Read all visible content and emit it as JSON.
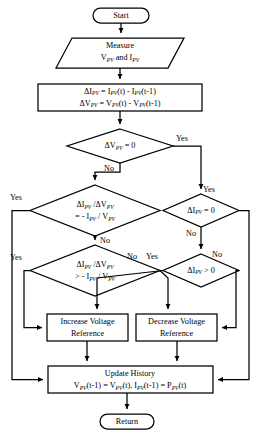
{
  "diagram": {
    "type": "flowchart",
    "nodes": {
      "start": {
        "shape": "terminator",
        "label": "Start"
      },
      "measure": {
        "shape": "parallelogram",
        "line1": "Measure",
        "line2_html": "V<sub>PV</sub> and I<sub>PV</sub>"
      },
      "delta": {
        "shape": "process",
        "line1_html": "ΔI<sub>PV</sub> = I<sub>PV</sub>(t) - I<sub>PV</sub>(t-1)",
        "line2_html": "ΔV<sub>PV</sub> = V<sub>PV</sub>(t) - V<sub>PV</sub>(t-1)"
      },
      "d1": {
        "shape": "decision",
        "label_html": "ΔV<sub>PV</sub> = 0",
        "yes": "Yes",
        "no": "No"
      },
      "d2": {
        "shape": "decision",
        "line1_html": "ΔI<sub>PV</sub> /ΔV<sub>PV</sub>",
        "line2_html": "= - I<sub>PV</sub> / V<sub>PV</sub>",
        "yes": "Yes",
        "no": "No"
      },
      "d3": {
        "shape": "decision",
        "label_html": "ΔI<sub>PV</sub> = 0",
        "yes": "Yes",
        "no": "No"
      },
      "d4": {
        "shape": "decision",
        "line1_html": "ΔI<sub>PV</sub> /ΔV<sub>PV</sub>",
        "line2_html": "> - I<sub>PV</sub> / V<sub>PV</sub>",
        "yes": "Yes",
        "no": "No"
      },
      "d5": {
        "shape": "decision",
        "label_html": "ΔI<sub>PV</sub> > 0",
        "yes": "Yes",
        "no": "No"
      },
      "increase": {
        "shape": "process",
        "line1": "Increase Voltage",
        "line2": "Reference"
      },
      "decrease": {
        "shape": "process",
        "line1": "Decrease Voltage",
        "line2": "Reference"
      },
      "update": {
        "shape": "process",
        "line1": "Update History",
        "line2_html": "V<sub>PV</sub>(t-1) = V<sub>PV</sub>(t), I<sub>PV</sub>(t-1) = P<sub>PV</sub>(t)"
      },
      "return": {
        "shape": "terminator",
        "label": "Return"
      }
    },
    "edge_labels": {
      "d1_yes": "Yes",
      "d1_no": "No",
      "d2_yes": "Yes",
      "d2_no": "No",
      "d3_yes": "Yes",
      "d3_no": "No",
      "d4_yes": "Yes",
      "d4_no": "No",
      "d5_yes": "Yes",
      "d5_no": "No"
    },
    "colors": {
      "stroke": "#000000",
      "fill": "#ffffff",
      "text": "#000000"
    }
  }
}
